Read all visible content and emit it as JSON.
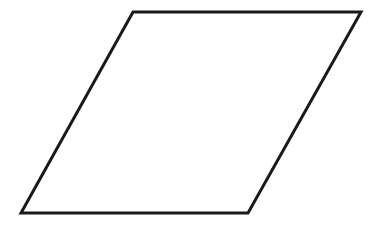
{
  "diagram": {
    "shape": "parallelogram",
    "background": "#ffffff",
    "fill": "#ffffff",
    "stroke": "#1a1a1a",
    "stroke_width": 3,
    "vertices": [
      {
        "x": 133,
        "y": 12
      },
      {
        "x": 361,
        "y": 12
      },
      {
        "x": 248,
        "y": 213
      },
      {
        "x": 21,
        "y": 213
      }
    ]
  }
}
